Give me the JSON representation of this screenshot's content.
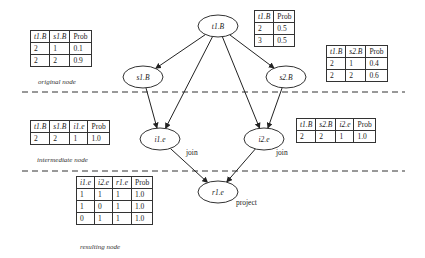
{
  "nodes": {
    "t1B": {
      "label": "t1.B",
      "cx": 218,
      "cy": 26
    },
    "s1B": {
      "label": "s1.B",
      "cx": 143,
      "cy": 77
    },
    "s2B": {
      "label": "s2.B",
      "cx": 286,
      "cy": 77
    },
    "i1e": {
      "label": "i1.e",
      "cx": 160,
      "cy": 139
    },
    "i2e": {
      "label": "i2.e",
      "cx": 264,
      "cy": 139
    },
    "r1e": {
      "label": "r1.e",
      "cx": 218,
      "cy": 192
    }
  },
  "edges": [
    {
      "from": "t1B",
      "to": "s1B"
    },
    {
      "from": "t1B",
      "to": "s2B"
    },
    {
      "from": "t1B",
      "to": "i1e"
    },
    {
      "from": "t1B",
      "to": "i2e"
    },
    {
      "from": "s1B",
      "to": "i1e"
    },
    {
      "from": "s2B",
      "to": "i2e"
    },
    {
      "from": "i1e",
      "to": "r1e"
    },
    {
      "from": "i2e",
      "to": "r1e"
    }
  ],
  "operation_labels": {
    "join_left": "join",
    "join_right": "join",
    "project": "project"
  },
  "captions": {
    "original": "original node",
    "intermediate": "intermediate node",
    "resulting": "resulting node"
  },
  "tables": {
    "t1B_prob": {
      "headers": [
        "t1.B",
        "Prob"
      ],
      "rows": [
        [
          "2",
          "0.5"
        ],
        [
          "3",
          "0.5"
        ]
      ]
    },
    "t1B_s1B_prob": {
      "headers": [
        "t1.B",
        "s1.B",
        "Prob"
      ],
      "rows": [
        [
          "2",
          "1",
          "0.1"
        ],
        [
          "2",
          "2",
          "0.9"
        ]
      ]
    },
    "t1B_s2B_prob": {
      "headers": [
        "t1.B",
        "s2.B",
        "Prob"
      ],
      "rows": [
        [
          "2",
          "1",
          "0.4"
        ],
        [
          "2",
          "2",
          "0.6"
        ]
      ]
    },
    "i1e_table": {
      "headers": [
        "t1.B",
        "s1.B",
        "i1.e",
        "Prob"
      ],
      "rows": [
        [
          "2",
          "2",
          "1",
          "1.0"
        ]
      ]
    },
    "i2e_table": {
      "headers": [
        "t1.B",
        "s2.B",
        "i2.e",
        "Prob"
      ],
      "rows": [
        [
          "2",
          "2",
          "1",
          "1.0"
        ]
      ]
    },
    "r1e_table": {
      "headers": [
        "i1.e",
        "i2.e",
        "r1.e",
        "Prob"
      ],
      "rows": [
        [
          "1",
          "1",
          "1",
          "1.0"
        ],
        [
          "1",
          "0",
          "1",
          "1.0"
        ],
        [
          "0",
          "1",
          "1",
          "1.0"
        ]
      ]
    }
  }
}
